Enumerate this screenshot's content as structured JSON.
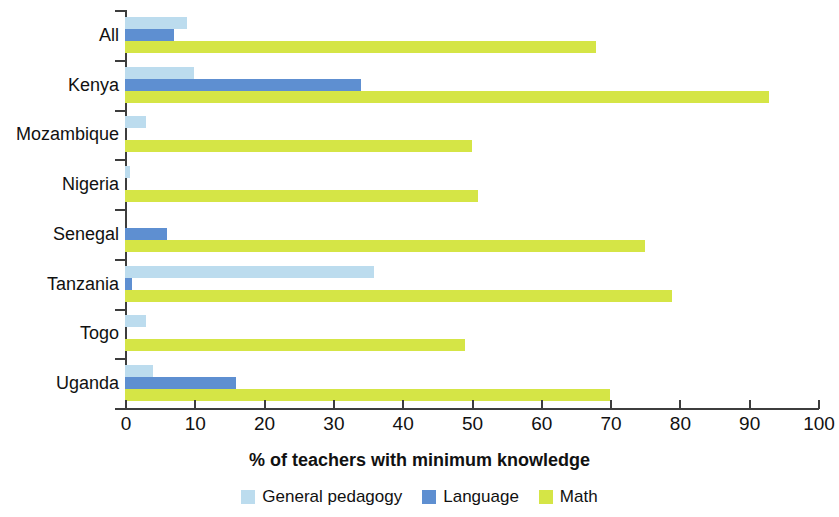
{
  "chart_data": {
    "type": "bar",
    "orientation": "horizontal",
    "title": "",
    "xlabel": "% of teachers with minimum knowledge",
    "ylabel": "",
    "xlim": [
      0,
      100
    ],
    "xticks": [
      0,
      10,
      20,
      30,
      40,
      50,
      60,
      70,
      80,
      90,
      100
    ],
    "grid": false,
    "legend_position": "bottom",
    "categories": [
      "All",
      "Kenya",
      "Mozambique",
      "Nigeria",
      "Senegal",
      "Tanzania",
      "Togo",
      "Uganda"
    ],
    "series": [
      {
        "name": "General pedagogy",
        "color": "#bcdcee",
        "values": [
          9,
          10,
          3,
          0.7,
          0,
          36,
          3,
          4
        ]
      },
      {
        "name": "Language",
        "color": "#5e8fd1",
        "values": [
          7,
          34,
          0,
          0,
          6,
          1,
          0,
          16
        ]
      },
      {
        "name": "Math",
        "color": "#d5e546",
        "values": [
          68,
          93,
          50,
          51,
          75,
          79,
          49,
          70
        ]
      }
    ]
  },
  "legend": {
    "items": [
      {
        "label": "General pedagogy",
        "color": "#bcdcee"
      },
      {
        "label": "Language",
        "color": "#5e8fd1"
      },
      {
        "label": "Math",
        "color": "#d5e546"
      }
    ]
  }
}
